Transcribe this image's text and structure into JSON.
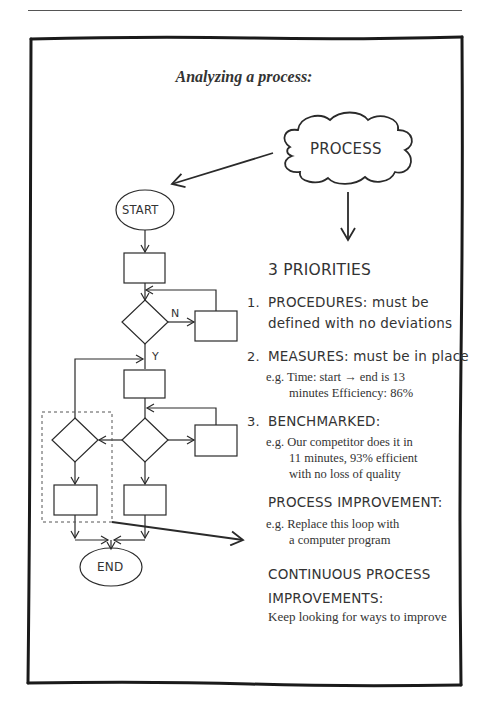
{
  "title": "Analyzing a process:",
  "diagram": {
    "cloud_label": "PROCESS",
    "start_label": "START",
    "end_label": "END",
    "no_label": "N",
    "yes_label": "Y"
  },
  "priorities": {
    "heading": "3 PRIORITIES",
    "items": [
      {
        "number": "1.",
        "label": "PROCEDURES:",
        "text_line1": "must be",
        "text_line2": "defined with no deviations"
      },
      {
        "number": "2.",
        "label": "MEASURES:",
        "text_line1": "must be in place",
        "example_prefix": "e.g.",
        "example_line1": "Time: start → end is 13",
        "example_line2": "minutes Efficiency: 86%"
      },
      {
        "number": "3.",
        "label": "BENCHMARKED:",
        "example_prefix": "e.g.",
        "example_line1": "Our competitor does it in",
        "example_line2": "11 minutes, 93% efficient",
        "example_line3": "with no loss of quality"
      }
    ]
  },
  "process_improvement": {
    "heading": "PROCESS IMPROVEMENT:",
    "example_prefix": "e.g.",
    "example_line1": "Replace this loop with",
    "example_line2": "a computer program"
  },
  "continuous": {
    "heading_line1": "CONTINUOUS PROCESS",
    "heading_line2": "IMPROVEMENTS:",
    "text": "Keep looking for ways to improve"
  },
  "colors": {
    "ink": "#2a2a2a",
    "border": "#1a1a1a",
    "background": "#ffffff"
  }
}
